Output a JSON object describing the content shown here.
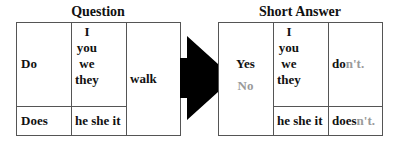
{
  "question": {
    "title": "Question",
    "aux_plural": "Do",
    "aux_singular": "Does",
    "pronouns_plural": [
      "I",
      "you",
      "we",
      "they"
    ],
    "pronouns_singular": "he she it",
    "verb": "walk"
  },
  "short_answer": {
    "title": "Short Answer",
    "yes": "Yes",
    "no": "No",
    "pronouns_plural": [
      "I",
      "you",
      "we",
      "they"
    ],
    "pronouns_singular": "he she it",
    "plural_answer": {
      "stem": "do",
      "suffix": "n't."
    },
    "singular_answer": {
      "stem": "does",
      "suffix": "n't."
    }
  },
  "colors": {
    "text": "#111111",
    "negative": "#9a9a9a",
    "border": "#555555",
    "arrow": "#000000"
  }
}
